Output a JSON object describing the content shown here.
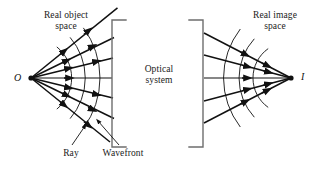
{
  "figure": {
    "background": "#ffffff",
    "ink": "#111111"
  },
  "labels": {
    "object_space": "Real object\nspace",
    "image_space": "Real image\nspace",
    "optical_system": "Optical\nsystem",
    "ray": "Ray",
    "wavefront": "Wavefront",
    "object_point": "O",
    "image_point": "I"
  },
  "diagram_data": {
    "type": "ray-diagram",
    "object_point": {
      "label": "O",
      "x": 31,
      "y": 78
    },
    "image_point": {
      "label": "I",
      "x": 291,
      "y": 78
    },
    "left_bracket": {
      "x": 112,
      "y_top": 20,
      "y_bottom": 147,
      "stub": 14,
      "opens": "right"
    },
    "right_bracket": {
      "x": 203,
      "y_top": 20,
      "y_bottom": 147,
      "stub": 14,
      "opens": "left"
    },
    "object_rays": {
      "count": 7,
      "angles_deg": [
        -39,
        -26,
        -13,
        0,
        13,
        26,
        39
      ],
      "direction": "diverging",
      "arrowheads": true
    },
    "image_rays": {
      "count": 5,
      "angles_deg": [
        -27,
        -14,
        0,
        14,
        27
      ],
      "direction": "converging",
      "arrowheads": true
    },
    "object_wavefronts": {
      "description": "concentric circular arcs centered on O, convex toward the optical system",
      "radii": [
        40,
        62,
        84
      ],
      "center": "object_point"
    },
    "image_wavefronts": {
      "description": "concentric circular arcs centered on I, concave toward the image point",
      "radii": [
        36,
        58,
        80
      ],
      "center": "image_point"
    },
    "leader_lines": [
      {
        "label": "Ray",
        "from_x": 72,
        "from_y": 145,
        "to_x": 84,
        "to_y": 126,
        "arrow": true
      },
      {
        "label": "Wavefront",
        "from_x": 118,
        "from_y": 145,
        "to_x": 97,
        "to_y": 122,
        "arrow": true
      }
    ]
  }
}
